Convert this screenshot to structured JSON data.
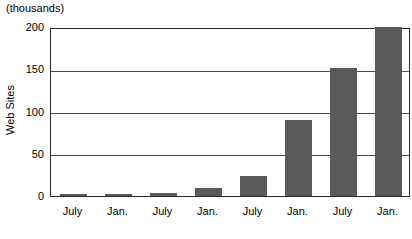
{
  "chart_data": {
    "type": "bar",
    "title": "",
    "units_caption": "(thousands)",
    "xlabel": "",
    "ylabel": "Web Sites",
    "categories": [
      "July",
      "Jan.",
      "July",
      "Jan.",
      "July",
      "Jan.",
      "July",
      "Jan."
    ],
    "values": [
      1,
      2,
      3,
      10,
      24,
      90,
      152,
      200
    ],
    "ylim": [
      0,
      200
    ],
    "yticks": [
      0,
      50,
      100,
      150,
      200
    ],
    "ytick_labels": [
      "0",
      "50",
      "100",
      "150",
      "200"
    ],
    "grid": true,
    "legend": "none",
    "bar_color": "#595959",
    "axis_color": "#2a2a2a",
    "background_color": "#ffffff"
  }
}
